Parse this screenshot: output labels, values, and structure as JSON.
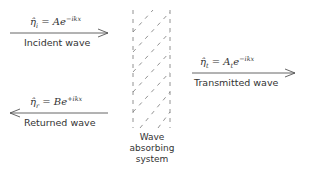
{
  "incident": {
    "equation_lhs": "η̂",
    "equation_sub": "i",
    "equation_rhs": "= Ae",
    "equation_exp": "−ikx",
    "label": "Incident wave"
  },
  "returned": {
    "equation_lhs": "η̂",
    "equation_sub": "r",
    "equation_rhs": "= Be",
    "equation_exp": "+ikx",
    "label": "Returned wave"
  },
  "transmitted": {
    "equation_lhs": "η̂",
    "equation_sub": "t",
    "equation_rhs": "= A",
    "equation_rhs_sub": "t",
    "equation_rhs2": "e",
    "equation_exp": "−ikx",
    "label": "Transmitted wave"
  },
  "system": {
    "line1": "Wave",
    "line2": "absorbing",
    "line3": "system"
  }
}
